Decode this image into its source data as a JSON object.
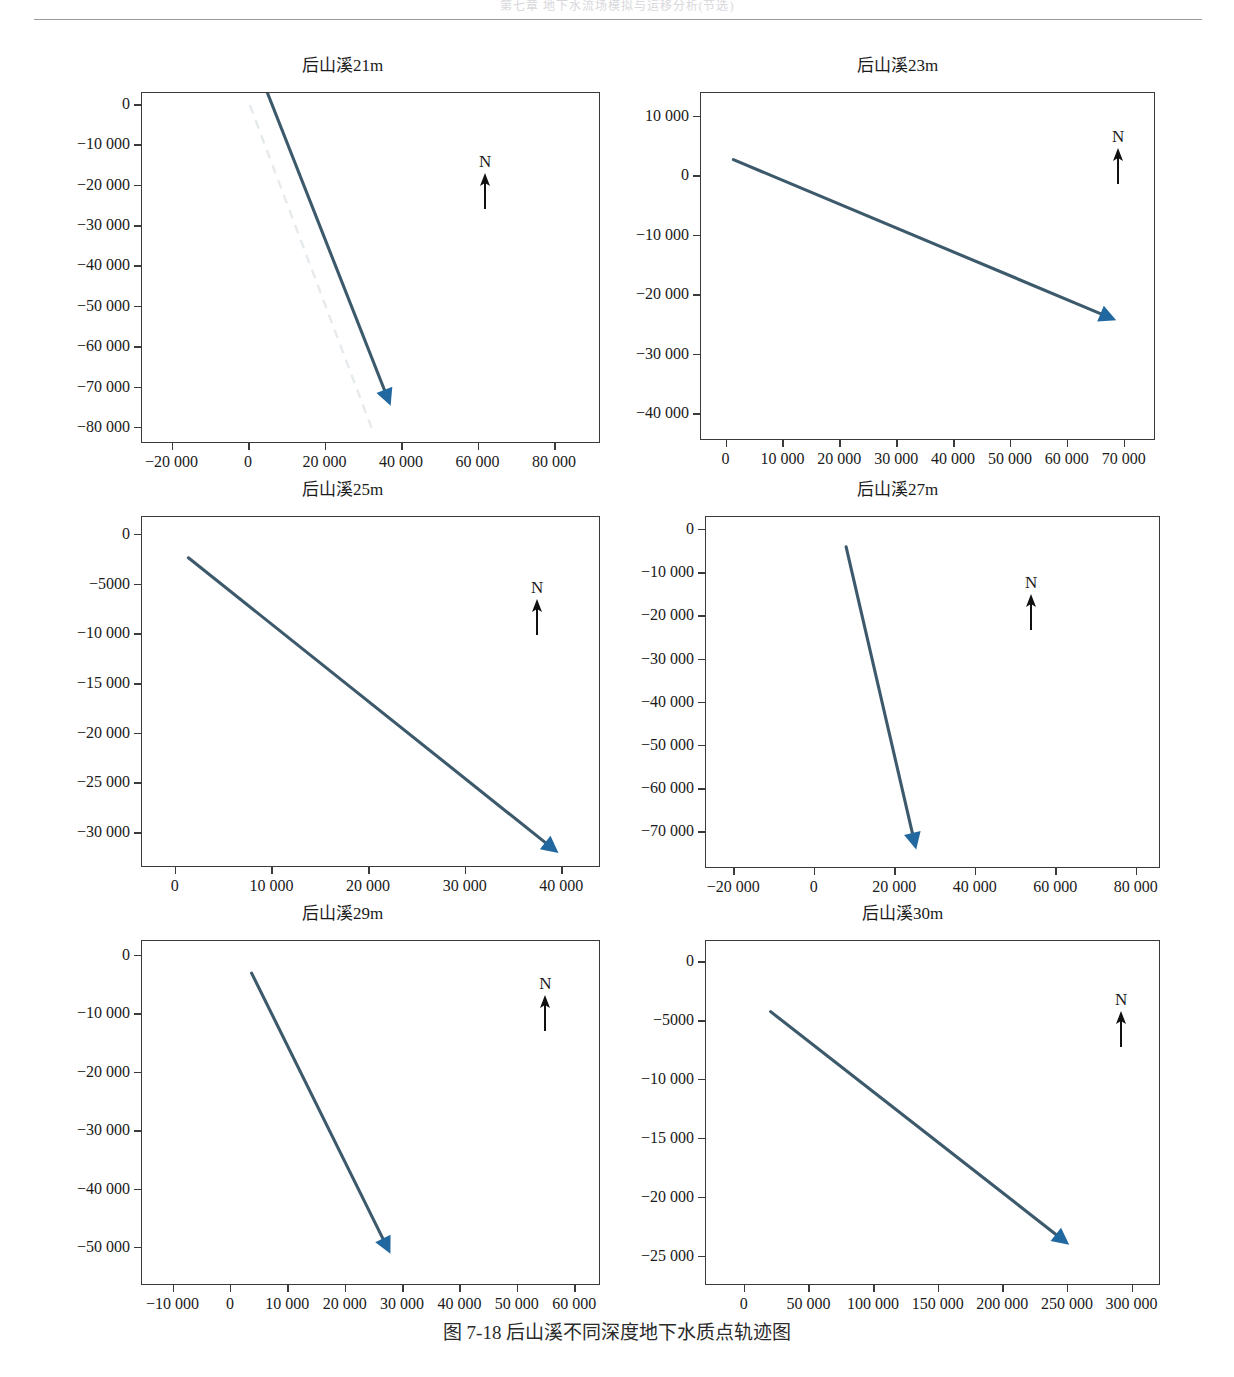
{
  "page": {
    "header_partial_text": "第七章 地下水流场模拟与运移分析(节选)",
    "caption": "图 7-18   后山溪不同深度地下水质点轨迹图",
    "caption_figure_number": "图 7-18",
    "caption_text": "后山溪不同深度地下水质点轨迹图"
  },
  "colors": {
    "track_line": "#3d5a6c",
    "arrow_head": "#20689f",
    "ghost_line": "#e7eaec",
    "axis": "#3a3a3a",
    "text": "#1a1a1a"
  },
  "compass": {
    "label": "N",
    "icon": "north-arrow-icon"
  },
  "chart_data": [
    {
      "id": "houshanxi-21m",
      "type": "line",
      "title": "后山溪21m",
      "xlabel": "",
      "ylabel": "",
      "xlim": [
        -28000,
        92000
      ],
      "ylim": [
        -84000,
        3000
      ],
      "xticks": [
        -20000,
        0,
        20000,
        40000,
        60000,
        80000
      ],
      "xticklabels": [
        "−20 000",
        "0",
        "20 000",
        "40 000",
        "60 000",
        "80 000"
      ],
      "yticks": [
        0,
        -10000,
        -20000,
        -30000,
        -40000,
        -50000,
        -60000,
        -70000,
        -80000
      ],
      "yticklabels": [
        "0",
        "−10 000",
        "−20 000",
        "−30 000",
        "−40 000",
        "−50 000",
        "−60 000",
        "−70 000",
        "−80 000"
      ],
      "grid": false,
      "legend": "none",
      "series": [
        {
          "name": "质点轨迹",
          "style": "solid-arrow",
          "x": [
            4800,
            37000
          ],
          "y": [
            3000,
            -74500
          ]
        },
        {
          "name": "参考轨迹",
          "style": "ghost",
          "x": [
            200,
            32000
          ],
          "y": [
            0,
            -80000
          ]
        }
      ],
      "annotations": [
        {
          "type": "compass",
          "label": "N",
          "x": 62000,
          "y": -12000
        }
      ]
    },
    {
      "id": "houshanxi-23m",
      "type": "line",
      "title": "后山溪23m",
      "xlabel": "",
      "ylabel": "",
      "xlim": [
        -4500,
        75500
      ],
      "ylim": [
        -44500,
        14000
      ],
      "xticks": [
        0,
        10000,
        20000,
        30000,
        40000,
        50000,
        60000,
        70000
      ],
      "xticklabels": [
        "0",
        "10 000",
        "20 000",
        "30 000",
        "40 000",
        "50 000",
        "60 000",
        "70 000"
      ],
      "yticks": [
        10000,
        0,
        -10000,
        -20000,
        -30000,
        -40000
      ],
      "yticklabels": [
        "10 000",
        "0",
        "−10 000",
        "−20 000",
        "−30 000",
        "−40 000"
      ],
      "grid": false,
      "legend": "none",
      "series": [
        {
          "name": "质点轨迹",
          "style": "solid-arrow",
          "x": [
            1200,
            68500
          ],
          "y": [
            2800,
            -24200
          ]
        }
      ],
      "annotations": [
        {
          "type": "compass",
          "label": "N",
          "x": 69000,
          "y": 8000
        }
      ]
    },
    {
      "id": "houshanxi-25m",
      "type": "line",
      "title": "后山溪25m",
      "xlabel": "",
      "ylabel": "",
      "xlim": [
        -3500,
        44000
      ],
      "ylim": [
        -33500,
        1800
      ],
      "xticks": [
        0,
        10000,
        20000,
        30000,
        40000
      ],
      "xticklabels": [
        "0",
        "10 000",
        "20 000",
        "30 000",
        "40 000"
      ],
      "yticks": [
        0,
        -5000,
        -10000,
        -15000,
        -20000,
        -25000,
        -30000
      ],
      "yticklabels": [
        "0",
        "−5000",
        "−10 000",
        "−15 000",
        "−20 000",
        "−25 000",
        "−30 000"
      ],
      "grid": false,
      "legend": "none",
      "series": [
        {
          "name": "质点轨迹",
          "style": "solid-arrow",
          "x": [
            1300,
            39600
          ],
          "y": [
            -2300,
            -32000
          ]
        }
      ],
      "annotations": [
        {
          "type": "compass",
          "label": "N",
          "x": 37500,
          "y": -4500
        }
      ]
    },
    {
      "id": "houshanxi-27m",
      "type": "line",
      "title": "后山溪27m",
      "xlabel": "",
      "ylabel": "",
      "xlim": [
        -27000,
        86000
      ],
      "ylim": [
        -78500,
        3000
      ],
      "xticks": [
        -20000,
        0,
        20000,
        40000,
        60000,
        80000
      ],
      "xticklabels": [
        "−20 000",
        "0",
        "20 000",
        "40 000",
        "60 000",
        "80 000"
      ],
      "yticks": [
        0,
        -10000,
        -20000,
        -30000,
        -40000,
        -50000,
        -60000,
        -70000
      ],
      "yticklabels": [
        "0",
        "−10 000",
        "−20 000",
        "−30 000",
        "−40 000",
        "−50 000",
        "−60 000",
        "−70 000"
      ],
      "grid": false,
      "legend": "none",
      "series": [
        {
          "name": "质点轨迹",
          "style": "solid-arrow",
          "x": [
            7800,
            25200
          ],
          "y": [
            -3900,
            -74000
          ]
        }
      ],
      "annotations": [
        {
          "type": "compass",
          "label": "N",
          "x": 54000,
          "y": -10500
        }
      ]
    },
    {
      "id": "houshanxi-29m",
      "type": "line",
      "title": "后山溪29m",
      "xlabel": "",
      "ylabel": "",
      "xlim": [
        -15500,
        64500
      ],
      "ylim": [
        -56500,
        2500
      ],
      "xticks": [
        -10000,
        0,
        10000,
        20000,
        30000,
        40000,
        50000,
        60000
      ],
      "xticklabels": [
        "−10 000",
        "0",
        "10 000",
        "20 000",
        "30 000",
        "40 000",
        "50 000",
        "60 000"
      ],
      "yticks": [
        0,
        -10000,
        -20000,
        -30000,
        -40000,
        -50000
      ],
      "yticklabels": [
        "0",
        "−10 000",
        "−20 000",
        "−30 000",
        "−40 000",
        "−50 000"
      ],
      "grid": false,
      "legend": "none",
      "series": [
        {
          "name": "质点轨迹",
          "style": "solid-arrow",
          "x": [
            3600,
            27800
          ],
          "y": [
            -3000,
            -51000
          ]
        }
      ],
      "annotations": [
        {
          "type": "compass",
          "label": "N",
          "x": 55000,
          "y": -3500
        }
      ]
    },
    {
      "id": "houshanxi-30m",
      "type": "line",
      "title": "后山溪30m",
      "xlabel": "",
      "ylabel": "",
      "xlim": [
        -30000,
        322000
      ],
      "ylim": [
        -27500,
        1800
      ],
      "xticks": [
        0,
        50000,
        100000,
        150000,
        200000,
        250000,
        300000
      ],
      "xticklabels": [
        "0",
        "50 000",
        "100 000",
        "150 000",
        "200 000",
        "250 000",
        "300 000"
      ],
      "yticks": [
        0,
        -5000,
        -10000,
        -15000,
        -20000,
        -25000
      ],
      "yticklabels": [
        "0",
        "−5000",
        "−10 000",
        "−15 000",
        "−20 000",
        "−25 000"
      ],
      "grid": false,
      "legend": "none",
      "series": [
        {
          "name": "质点轨迹",
          "style": "solid-arrow",
          "x": [
            20000,
            251000
          ],
          "y": [
            -4200,
            -24000
          ]
        }
      ],
      "annotations": [
        {
          "type": "compass",
          "label": "N",
          "x": 292000,
          "y": -2500
        }
      ]
    }
  ],
  "layout": {
    "panels": [
      {
        "left": 70,
        "top": 0,
        "width": 545,
        "height": 420,
        "plot": {
          "left": 71,
          "top": 36,
          "width": 459,
          "height": 351
        }
      },
      {
        "left": 625,
        "top": 0,
        "width": 545,
        "height": 420,
        "plot": {
          "left": 75,
          "top": 36,
          "width": 455,
          "height": 348
        }
      },
      {
        "left": 70,
        "top": 424,
        "width": 545,
        "height": 420,
        "plot": {
          "left": 71,
          "top": 36,
          "width": 459,
          "height": 351
        }
      },
      {
        "left": 625,
        "top": 424,
        "width": 545,
        "height": 420,
        "plot": {
          "left": 80,
          "top": 36,
          "width": 455,
          "height": 352
        }
      },
      {
        "left": 70,
        "top": 848,
        "width": 545,
        "height": 412,
        "plot": {
          "left": 71,
          "top": 36,
          "width": 459,
          "height": 345
        }
      },
      {
        "left": 625,
        "top": 848,
        "width": 555,
        "height": 412,
        "plot": {
          "left": 80,
          "top": 36,
          "width": 455,
          "height": 345
        }
      }
    ]
  }
}
